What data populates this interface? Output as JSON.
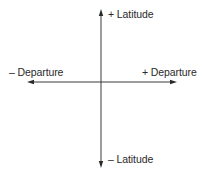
{
  "diagram": {
    "type": "coordinate-axes",
    "colors": {
      "axis": "#3a3a3a",
      "text": "#2a2a2a",
      "background": "#ffffff"
    },
    "axes": {
      "vertical": {
        "positive_label": "+ Latitude",
        "negative_label": "– Latitude"
      },
      "horizontal": {
        "positive_label": "+ Departure",
        "negative_label": "– Departure"
      }
    }
  }
}
